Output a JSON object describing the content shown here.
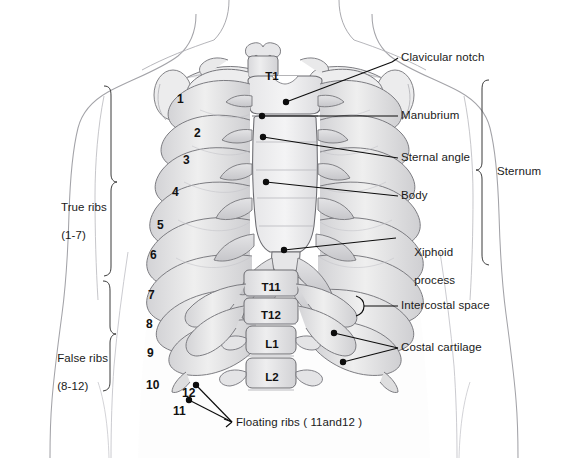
{
  "figure": {
    "palette": {
      "background": "#ffffff",
      "body_fill": "#fbfbfc",
      "body_outline": "#9a9a9f",
      "bone_fill": "#e9e9ea",
      "bone_fill_light": "#f2f2f3",
      "bone_shade": "#c9c9cc",
      "bone_shade_dark": "#a9a9ad",
      "bone_outline": "#6f6f74",
      "leader_line": "#0d0d0d",
      "text": "#1a1a1a"
    }
  },
  "labels": {
    "clavicular_notch": "Clavicular notch",
    "manubrium": "Manubrium",
    "sternal_angle": "Sternal angle",
    "body": "Body",
    "xiphoid_process_line1": "Xiphoid",
    "xiphoid_process_line2": "process",
    "intercostal_space": "Intercostal space",
    "costal_cartilage": "Costal cartilage",
    "sternum_bracket": "Sternum",
    "true_ribs_line1": "True ribs",
    "true_ribs_line2": "(1-7)",
    "false_ribs_line1": "False ribs",
    "false_ribs_line2": "(8-12)",
    "floating_ribs": "Floating ribs ( 11and12 )"
  },
  "rib_numbers": [
    {
      "n": "1",
      "x": 177,
      "y": 92
    },
    {
      "n": "2",
      "x": 194,
      "y": 126
    },
    {
      "n": "3",
      "x": 183,
      "y": 153
    },
    {
      "n": "4",
      "x": 172,
      "y": 185
    },
    {
      "n": "5",
      "x": 157,
      "y": 218
    },
    {
      "n": "6",
      "x": 150,
      "y": 248
    },
    {
      "n": "7",
      "x": 148,
      "y": 288
    },
    {
      "n": "8",
      "x": 146,
      "y": 317
    },
    {
      "n": "9",
      "x": 147,
      "y": 346
    },
    {
      "n": "10",
      "x": 146,
      "y": 378
    },
    {
      "n": "11",
      "x": 173,
      "y": 404
    },
    {
      "n": "12",
      "x": 182,
      "y": 386
    }
  ],
  "vertebrae": [
    {
      "id": "T1",
      "x": 254,
      "y": 70,
      "w": 36
    },
    {
      "id": "T11",
      "x": 248,
      "y": 281,
      "w": 46
    },
    {
      "id": "T12",
      "x": 248,
      "y": 309,
      "w": 46
    },
    {
      "id": "L1",
      "x": 253,
      "y": 338,
      "w": 38
    },
    {
      "id": "L2",
      "x": 253,
      "y": 371,
      "w": 38
    }
  ]
}
